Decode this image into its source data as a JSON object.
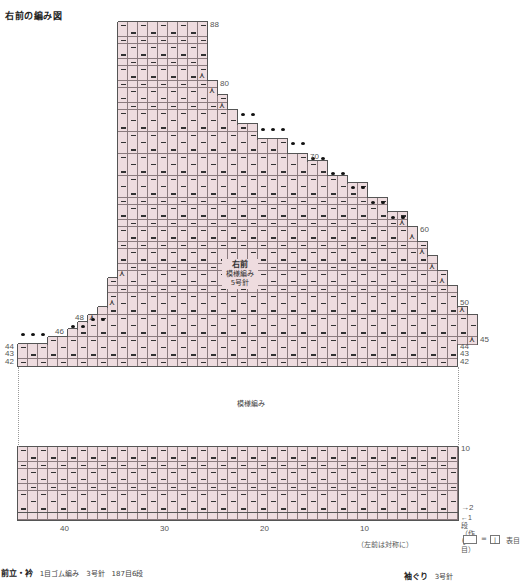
{
  "title": "右前の編み図",
  "grid": {
    "origin_x": 18,
    "cell_w": 10,
    "row_h": 7.32,
    "top_y": 22,
    "top_row": 88,
    "bottom_row": 42,
    "stitches": 44,
    "cell_color": "#eedcdf",
    "line_color": "#8a7a7d",
    "rows": [
      {
        "r": 88,
        "l": 10,
        "w": 9
      },
      {
        "r": 87,
        "l": 10,
        "w": 9
      },
      {
        "r": 86,
        "l": 10,
        "w": 9
      },
      {
        "r": 85,
        "l": 10,
        "w": 9
      },
      {
        "r": 84,
        "l": 10,
        "w": 9
      },
      {
        "r": 83,
        "l": 10,
        "w": 9
      },
      {
        "r": 82,
        "l": 10,
        "w": 9
      },
      {
        "r": 81,
        "l": 10,
        "w": 9,
        "dec_right": true
      },
      {
        "r": 80,
        "l": 10,
        "w": 10
      },
      {
        "r": 79,
        "l": 10,
        "w": 10,
        "dec_right": true
      },
      {
        "r": 78,
        "l": 10,
        "w": 11
      },
      {
        "r": 77,
        "l": 10,
        "w": 11,
        "dec_right": true
      },
      {
        "r": 76,
        "l": 10,
        "w": 12
      },
      {
        "r": 75,
        "l": 10,
        "w": 12
      },
      {
        "r": 74,
        "l": 10,
        "w": 14
      },
      {
        "r": 73,
        "l": 10,
        "w": 14
      },
      {
        "r": 72,
        "l": 10,
        "w": 17
      },
      {
        "r": 71,
        "l": 10,
        "w": 17
      },
      {
        "r": 70,
        "l": 10,
        "w": 19
      },
      {
        "r": 69,
        "l": 10,
        "w": 21
      },
      {
        "r": 68,
        "l": 10,
        "w": 21
      },
      {
        "r": 67,
        "l": 10,
        "w": 23
      },
      {
        "r": 66,
        "l": 10,
        "w": 25
      },
      {
        "r": 65,
        "l": 10,
        "w": 25
      },
      {
        "r": 64,
        "l": 10,
        "w": 27
      },
      {
        "r": 63,
        "l": 10,
        "w": 27
      },
      {
        "r": 62,
        "l": 10,
        "w": 29
      },
      {
        "r": 61,
        "l": 10,
        "w": 29,
        "dec_right": true
      },
      {
        "r": 60,
        "l": 10,
        "w": 30
      },
      {
        "r": 59,
        "l": 10,
        "w": 30,
        "dec_right": true
      },
      {
        "r": 58,
        "l": 10,
        "w": 31
      },
      {
        "r": 57,
        "l": 10,
        "w": 31,
        "dec_right": true
      },
      {
        "r": 56,
        "l": 10,
        "w": 32
      },
      {
        "r": 55,
        "l": 10,
        "w": 32,
        "dec_right": true
      },
      {
        "r": 54,
        "l": 10,
        "w": 33,
        "dec_left": true
      },
      {
        "r": 53,
        "l": 9,
        "w": 34,
        "dec_right": true
      },
      {
        "r": 52,
        "l": 9,
        "w": 35
      },
      {
        "r": 51,
        "l": 9,
        "w": 35
      },
      {
        "r": 50,
        "l": 9,
        "w": 35,
        "dec_left": true
      },
      {
        "r": 49,
        "l": 8,
        "w": 37,
        "dec_right": true
      },
      {
        "r": 48,
        "l": 7,
        "w": 39,
        "dec_left": true
      },
      {
        "r": 47,
        "l": 6,
        "w": 40
      },
      {
        "r": 46,
        "l": 5,
        "w": 41
      },
      {
        "r": 45,
        "l": 3,
        "w": 43,
        "dec_right": true
      },
      {
        "r": 44,
        "l": 0,
        "w": 44
      },
      {
        "r": 43,
        "l": 0,
        "w": 44
      },
      {
        "r": 42,
        "l": 0,
        "w": 44
      }
    ],
    "bullets": [
      {
        "row": 75,
        "cols": [
          22,
          23
        ]
      },
      {
        "row": 73,
        "cols": [
          24,
          25,
          26
        ]
      },
      {
        "row": 71,
        "cols": [
          27,
          28
        ]
      },
      {
        "row": 69,
        "cols": [
          29,
          30
        ]
      },
      {
        "row": 67,
        "cols": [
          31,
          32
        ]
      },
      {
        "row": 65,
        "cols": [
          33,
          34
        ]
      },
      {
        "row": 63,
        "cols": [
          35,
          36
        ]
      },
      {
        "row": 61,
        "cols": [
          37,
          38
        ]
      },
      {
        "row": 47,
        "cols": [
          7,
          8
        ]
      },
      {
        "row": 46,
        "cols": [
          5,
          6
        ]
      },
      {
        "row": 45,
        "cols": [
          0,
          1,
          2
        ]
      }
    ],
    "right_labels": [
      {
        "row": 88,
        "text": "88"
      },
      {
        "row": 80,
        "text": "80"
      },
      {
        "row": 70,
        "text": "70"
      },
      {
        "row": 60,
        "text": "60"
      },
      {
        "row": 50,
        "text": "50"
      },
      {
        "row": 45,
        "text": "45"
      },
      {
        "row": 44,
        "text": "44"
      },
      {
        "row": 43,
        "text": "43"
      },
      {
        "row": 42,
        "text": "42"
      }
    ],
    "left_labels": [
      {
        "row": 48,
        "text": "48"
      },
      {
        "row": 46,
        "text": "46"
      },
      {
        "row": 44,
        "text": "44"
      },
      {
        "row": 43,
        "text": "43"
      },
      {
        "row": 42,
        "text": "42"
      }
    ]
  },
  "center_label": {
    "line1": "右前",
    "line2": "模様編み",
    "line3": "5号針"
  },
  "gap_label": "模様編み",
  "bottom_grid": {
    "top_y": 447,
    "rows": 10,
    "row_h": 7.3,
    "top_label": "10",
    "label_2": "→2",
    "label_1": "←1段（作り目）"
  },
  "x_ticks": [
    {
      "text": "40",
      "col": 40
    },
    {
      "text": "30",
      "col": 30
    },
    {
      "text": "20",
      "col": 20
    },
    {
      "text": "10",
      "col": 10
    }
  ],
  "note_symmetry": "（左前は対称に）",
  "legend": {
    "equals": "=",
    "symbol": "|",
    "text": "表目"
  },
  "footer_left": {
    "bold": "前立・衿",
    "rest": "1目ゴム編み　3号針　187目6段"
  },
  "footer_right": {
    "bold": "袖ぐり",
    "rest": "3号針"
  }
}
